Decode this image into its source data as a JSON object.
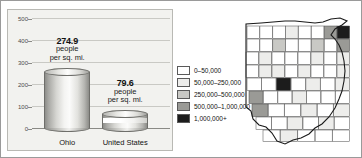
{
  "chart_data": {
    "type": "bar",
    "categories": [
      "Ohio",
      "United States"
    ],
    "values": [
      274.9,
      79.6
    ],
    "value_labels": [
      "274.9",
      "79.6"
    ],
    "unit_line1": "people",
    "unit_line2": "per sq. mi.",
    "title": "",
    "xlabel": "",
    "ylabel": "",
    "ylim": [
      0,
      500
    ],
    "yticks": [
      500,
      400,
      300,
      200,
      100,
      0
    ],
    "grid": true,
    "legend_position": "right"
  },
  "legend": {
    "items": [
      {
        "label": "0–50,000",
        "color": "#ffffff"
      },
      {
        "label": "50,000–250,000",
        "color": "#ededeb"
      },
      {
        "label": "250,000–500,000",
        "color": "#c9c9c5"
      },
      {
        "label": "500,000–1,000,000",
        "color": "#9a9a96"
      },
      {
        "label": "1,000,000+",
        "color": "#1c1c1c"
      }
    ]
  },
  "map": {
    "name": "ohio-county-map",
    "state": "Ohio"
  }
}
